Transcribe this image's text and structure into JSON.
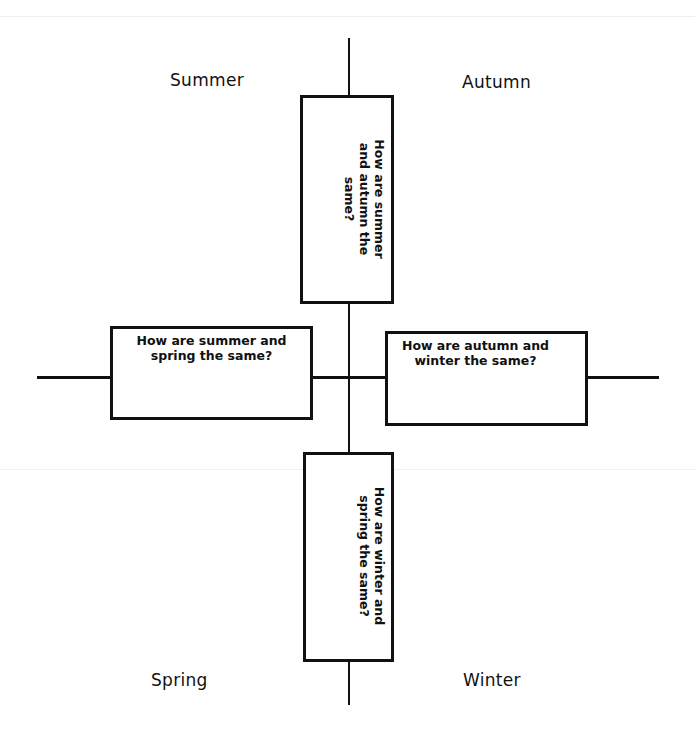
{
  "diagram": {
    "type": "four-quadrant comparison organizer",
    "quadrants": {
      "top_left": "Summer",
      "top_right": "Autumn",
      "bottom_left": "Spring",
      "bottom_right": "Winter"
    },
    "boxes": {
      "top": "How are summer and autumn the same?",
      "left": "How are summer and spring the same?",
      "right": "How are autumn and winter the same?",
      "bottom": "How are winter and spring the same?"
    },
    "colors": {
      "line": "#111111",
      "background": "#ffffff"
    }
  }
}
